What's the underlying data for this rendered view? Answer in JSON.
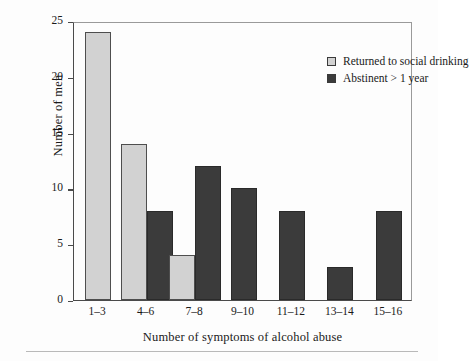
{
  "chart_data": {
    "type": "bar",
    "title": "",
    "xlabel": "Number of symptoms of alcohol abuse",
    "ylabel": "Number of men",
    "categories": [
      "1–3",
      "4–6",
      "7–8",
      "9–10",
      "11–12",
      "13–14",
      "15–16"
    ],
    "series": [
      {
        "name": "Returned to social drinking",
        "color": "#d2d2d2",
        "values": [
          24,
          14,
          4,
          0,
          0,
          0,
          0
        ]
      },
      {
        "name": "Abstinent > 1 year",
        "color": "#3b3b3b",
        "values": [
          0,
          8,
          12,
          10,
          8,
          3,
          8
        ]
      }
    ],
    "ylim": [
      0,
      25
    ],
    "yticks": [
      0,
      5,
      10,
      15,
      20,
      25
    ],
    "ytick_labels": [
      "0",
      "5",
      "10",
      "15",
      "20",
      "25"
    ],
    "grid": false,
    "legend_position": "top-right"
  },
  "legend": {
    "items": [
      {
        "label": "Returned to social drinking",
        "swatch": "light"
      },
      {
        "label": "Abstinent > 1 year",
        "swatch": "dark"
      }
    ]
  },
  "axes": {
    "y_title": "Number of men",
    "x_title": "Number of symptoms of alcohol abuse"
  }
}
